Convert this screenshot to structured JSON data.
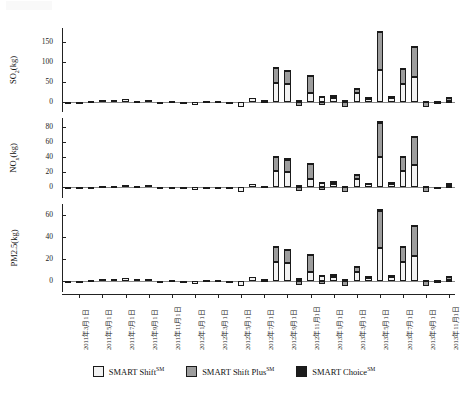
{
  "figure": {
    "title": "",
    "background": "#ffffff"
  },
  "legend": {
    "position": "bottom-center",
    "items": [
      {
        "label": "SMART Shift",
        "sup": "SM",
        "color": "#f2f2f2",
        "name": "smart-shift"
      },
      {
        "label": "SMART Shift Plus",
        "sup": "SM",
        "color": "#9d9d9d",
        "name": "smart-shift-plus"
      },
      {
        "label": "SMART Choice",
        "sup": "SM",
        "color": "#1c1c1c",
        "name": "smart-choice"
      }
    ]
  },
  "chart_data": {
    "type": "bar",
    "stacked": true,
    "title": "",
    "xlabel": "",
    "grid": false,
    "legend_position": "bottom-center",
    "series_names": [
      "SMART Shiftᴹ",
      "SMART Shift Plusᴹ",
      "SMART Choiceᴹ"
    ],
    "series_colors": [
      "#f2f2f2",
      "#9d9d9d",
      "#1c1c1c"
    ],
    "x_tick_labels": [
      "2011年3月1日",
      "2011年5月1日",
      "2011年7月1日",
      "2011年9月1日",
      "2011年11月1日",
      "2012年1月1日",
      "2012年3月1日",
      "2012年5月1日",
      "2012年7月1日",
      "2012年9月1日",
      "2012年11月1日",
      "2013年1月1日",
      "2013年3月1日",
      "2013年5月1日",
      "2013年7月1日",
      "2013年9月1日",
      "2013年11月1日"
    ],
    "x_categories": [
      "2011-02",
      "2011-03",
      "2011-04",
      "2011-05",
      "2011-06",
      "2011-07",
      "2011-08",
      "2011-09",
      "2011-10",
      "2011-11",
      "2011-12",
      "2012-01",
      "2012-02",
      "2012-03",
      "2012-04",
      "2012-05",
      "2012-06",
      "2012-07",
      "2012-08",
      "2012-09",
      "2012-10",
      "2012-11",
      "2012-12",
      "2013-01",
      "2013-02",
      "2013-03",
      "2013-04",
      "2013-05",
      "2013-06",
      "2013-07",
      "2013-08",
      "2013-09",
      "2013-10",
      "2013-11"
    ],
    "panels": [
      {
        "id": "so2",
        "ylabel": "SO",
        "ylabel_sub": "2",
        "ylabel_unit": "(kg)",
        "ylabel_full": "SO2(kg)",
        "yticks": [
          0,
          50,
          100,
          150
        ],
        "ylim": [
          -25,
          185
        ],
        "series": [
          {
            "name": "SMART Shift",
            "values": [
              -1,
              1,
              1.5,
              4,
              4.5,
              7,
              3.5,
              5.5,
              0.5,
              2,
              -4,
              -8,
              2.5,
              2.5,
              -2,
              -12,
              10,
              3,
              47,
              45,
              4,
              22,
              12,
              10,
              4,
              22,
              8,
              80,
              10,
              46,
              62,
              0,
              -4,
              3
            ]
          },
          {
            "name": "SMART Shift Plus",
            "values": [
              0,
              0,
              0,
              0,
              0,
              0,
              0,
              0,
              0,
              0,
              0,
              0,
              0,
              0,
              0,
              0,
              0,
              2,
              38,
              33,
              -10,
              44,
              -8,
              5,
              -12,
              12,
              3,
              95,
              3,
              38,
              76,
              -12,
              0,
              8
            ]
          },
          {
            "name": "SMART Choice",
            "values": [
              0,
              0,
              0,
              0,
              0,
              0,
              0,
              0,
              0,
              0,
              0,
              0,
              0,
              0,
              0,
              0,
              0,
              0,
              2,
              3,
              2,
              2,
              2,
              2,
              1,
              2,
              1,
              3,
              1,
              2,
              3,
              3,
              2,
              2
            ]
          }
        ]
      },
      {
        "id": "nox",
        "ylabel": "NO",
        "ylabel_sub": "x",
        "ylabel_unit": "(kg)",
        "ylabel_full": "NOx(kg)",
        "yticks": [
          0,
          20,
          40,
          60,
          80
        ],
        "ylim": [
          -14,
          92
        ],
        "series": [
          {
            "name": "SMART Shift",
            "values": [
              -0.5,
              0.5,
              0.8,
              2.2,
              2.4,
              3.6,
              1.8,
              3,
              0.3,
              1,
              -2,
              -4,
              1.2,
              1.2,
              -1,
              -6,
              5,
              1.5,
              22,
              21,
              2,
              11,
              6,
              5,
              2,
              11,
              4,
              40,
              5,
              22,
              30,
              0,
              -2,
              1.5
            ]
          },
          {
            "name": "SMART Shift Plus",
            "values": [
              0,
              0,
              0,
              0,
              0,
              0,
              0,
              0,
              0,
              0,
              0,
              0,
              0,
              0,
              0,
              0,
              0,
              1,
              19,
              16,
              -5,
              21,
              -4,
              2.5,
              -6,
              6,
              1.5,
              46,
              1.5,
              19,
              37,
              -6,
              0,
              4
            ]
          },
          {
            "name": "SMART Choice",
            "values": [
              0,
              0,
              0,
              0,
              0,
              0,
              0,
              0,
              0,
              0,
              0,
              0,
              0,
              0,
              0,
              0,
              0,
              0,
              1,
              1.5,
              1,
              1,
              1,
              1,
              0.5,
              1,
              0.5,
              1.5,
              0.5,
              1,
              1.5,
              1.5,
              1,
              1
            ]
          }
        ]
      },
      {
        "id": "pm25",
        "ylabel": "PM2.5",
        "ylabel_sub": "",
        "ylabel_unit": "(kg)",
        "ylabel_full": "PM2.5(kg)",
        "yticks": [
          0,
          20,
          40,
          60
        ],
        "ylim": [
          -10,
          70
        ],
        "series": [
          {
            "name": "SMART Shift",
            "values": [
              -0.4,
              0.4,
              0.6,
              1.6,
              1.8,
              2.8,
              1.4,
              2.2,
              0.2,
              0.8,
              -1.6,
              -3,
              1,
              1,
              -0.8,
              -4.5,
              4,
              1.2,
              17,
              16,
              1.5,
              8,
              4.5,
              4,
              1.5,
              8,
              3,
              30,
              4,
              17,
              23,
              0,
              -1.5,
              1.2
            ]
          },
          {
            "name": "SMART Shift Plus",
            "values": [
              0,
              0,
              0,
              0,
              0,
              0,
              0,
              0,
              0,
              0,
              0,
              0,
              0,
              0,
              0,
              0,
              0,
              0.8,
              14,
              12,
              -4,
              16,
              -3,
              2,
              -4.5,
              4.5,
              1.2,
              34,
              1.2,
              14,
              27,
              -4.5,
              0,
              3
            ]
          },
          {
            "name": "SMART Choice",
            "values": [
              0,
              0,
              0,
              0,
              0,
              0,
              0,
              0,
              0,
              0,
              0,
              0,
              0,
              0,
              0,
              0,
              0,
              0,
              0.8,
              1.2,
              0.8,
              0.8,
              0.8,
              0.8,
              0.4,
              0.8,
              0.4,
              1.2,
              0.4,
              0.8,
              1.2,
              1.2,
              0.8,
              0.8
            ]
          }
        ]
      }
    ]
  }
}
